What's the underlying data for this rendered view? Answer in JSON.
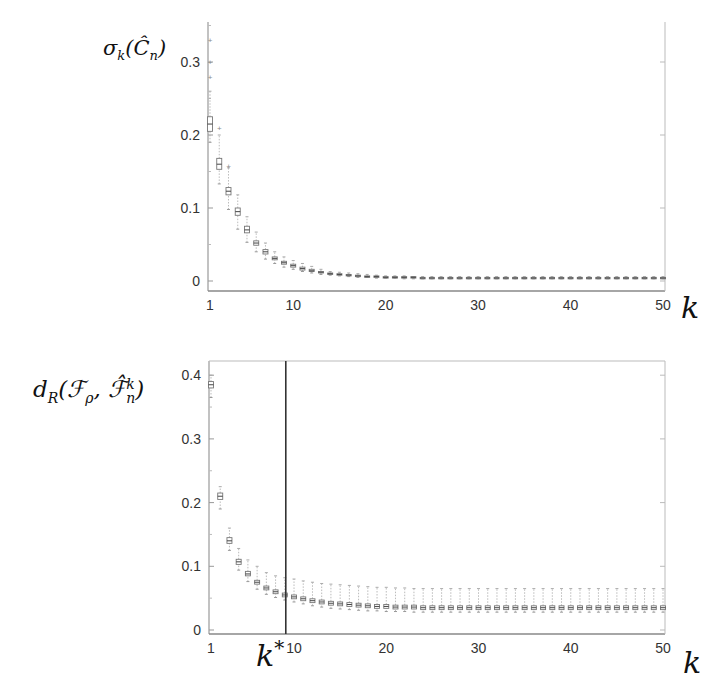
{
  "chart_data": [
    {
      "type": "box",
      "title": "",
      "ylabel": "σ_k(Ĉ_n)",
      "xlabel": "k",
      "xlim": [
        1,
        50
      ],
      "ylim": [
        -0.01,
        0.35
      ],
      "xticks": [
        1,
        10,
        20,
        30,
        40,
        50
      ],
      "yticks": [
        0,
        0.1,
        0.2,
        0.3
      ],
      "ytick_labels": [
        "0",
        "0.1",
        "0.2",
        "0.3"
      ],
      "grid": false,
      "x": [
        1,
        2,
        3,
        4,
        5,
        6,
        7,
        8,
        9,
        10,
        11,
        12,
        13,
        14,
        15,
        16,
        17,
        18,
        19,
        20,
        21,
        22,
        23,
        24,
        25,
        26,
        27,
        28,
        29,
        30,
        31,
        32,
        33,
        34,
        35,
        36,
        37,
        38,
        39,
        40,
        41,
        42,
        43,
        44,
        45,
        46,
        47,
        48,
        49,
        50
      ],
      "median": [
        0.215,
        0.16,
        0.123,
        0.095,
        0.07,
        0.052,
        0.04,
        0.031,
        0.025,
        0.021,
        0.017,
        0.014,
        0.012,
        0.01,
        0.009,
        0.008,
        0.007,
        0.006,
        0.006,
        0.005,
        0.005,
        0.005,
        0.005,
        0.004,
        0.004,
        0.004,
        0.004,
        0.004,
        0.004,
        0.004,
        0.004,
        0.004,
        0.004,
        0.004,
        0.004,
        0.004,
        0.004,
        0.004,
        0.004,
        0.004,
        0.004,
        0.004,
        0.004,
        0.004,
        0.004,
        0.004,
        0.004,
        0.004,
        0.004,
        0.004
      ],
      "q1": [
        0.205,
        0.153,
        0.118,
        0.09,
        0.066,
        0.049,
        0.037,
        0.029,
        0.023,
        0.019,
        0.015,
        0.013,
        0.011,
        0.009,
        0.008,
        0.007,
        0.006,
        0.005,
        0.005,
        0.004,
        0.004,
        0.004,
        0.004,
        0.003,
        0.003,
        0.003,
        0.003,
        0.003,
        0.003,
        0.003,
        0.003,
        0.003,
        0.003,
        0.003,
        0.003,
        0.003,
        0.003,
        0.003,
        0.003,
        0.003,
        0.003,
        0.003,
        0.003,
        0.003,
        0.003,
        0.003,
        0.003,
        0.003,
        0.003,
        0.003
      ],
      "q3": [
        0.225,
        0.168,
        0.128,
        0.1,
        0.075,
        0.055,
        0.043,
        0.033,
        0.027,
        0.023,
        0.019,
        0.016,
        0.013,
        0.011,
        0.01,
        0.009,
        0.008,
        0.007,
        0.007,
        0.006,
        0.006,
        0.006,
        0.006,
        0.005,
        0.005,
        0.005,
        0.005,
        0.005,
        0.005,
        0.005,
        0.005,
        0.005,
        0.005,
        0.005,
        0.005,
        0.005,
        0.005,
        0.005,
        0.005,
        0.005,
        0.005,
        0.005,
        0.005,
        0.005,
        0.005,
        0.005,
        0.005,
        0.005,
        0.005,
        0.005
      ],
      "whisker_low": [
        0.19,
        0.133,
        0.098,
        0.071,
        0.053,
        0.04,
        0.03,
        0.024,
        0.019,
        0.016,
        0.013,
        0.011,
        0.009,
        0.008,
        0.007,
        0.006,
        0.005,
        0.005,
        0.004,
        0.004,
        0.004,
        0.003,
        0.003,
        0.003,
        0.003,
        0.003,
        0.003,
        0.003,
        0.003,
        0.003,
        0.003,
        0.003,
        0.003,
        0.003,
        0.003,
        0.003,
        0.003,
        0.003,
        0.003,
        0.003,
        0.003,
        0.003,
        0.003,
        0.003,
        0.003,
        0.003,
        0.003,
        0.003,
        0.003,
        0.003
      ],
      "whisker_high": [
        0.26,
        0.2,
        0.155,
        0.118,
        0.088,
        0.067,
        0.052,
        0.04,
        0.033,
        0.028,
        0.024,
        0.02,
        0.016,
        0.013,
        0.012,
        0.011,
        0.01,
        0.009,
        0.008,
        0.007,
        0.007,
        0.007,
        0.006,
        0.006,
        0.006,
        0.006,
        0.006,
        0.006,
        0.006,
        0.006,
        0.006,
        0.006,
        0.006,
        0.006,
        0.006,
        0.006,
        0.006,
        0.006,
        0.006,
        0.006,
        0.006,
        0.006,
        0.006,
        0.006,
        0.006,
        0.006,
        0.006,
        0.006,
        0.006,
        0.006
      ],
      "outliers_high": [
        [
          1,
          0.28
        ],
        [
          1,
          0.3
        ],
        [
          1,
          0.33
        ],
        [
          2,
          0.21
        ],
        [
          3,
          0.158
        ]
      ]
    },
    {
      "type": "box",
      "title": "",
      "ylabel": "d_R(F_ρ, F̂_n^k)",
      "xlabel": "k",
      "xlim": [
        1,
        50
      ],
      "ylim": [
        -0.005,
        0.42
      ],
      "xticks": [
        1,
        10,
        20,
        30,
        40,
        50
      ],
      "yticks": [
        0,
        0.1,
        0.2,
        0.3,
        0.4
      ],
      "ytick_labels": [
        "0",
        "0.1",
        "0.2",
        "0.3",
        "0.4"
      ],
      "grid": false,
      "annotations": [
        {
          "type": "vline",
          "x": 9,
          "label": "k*"
        }
      ],
      "x": [
        1,
        2,
        3,
        4,
        5,
        6,
        7,
        8,
        9,
        10,
        11,
        12,
        13,
        14,
        15,
        16,
        17,
        18,
        19,
        20,
        21,
        22,
        23,
        24,
        25,
        26,
        27,
        28,
        29,
        30,
        31,
        32,
        33,
        34,
        35,
        36,
        37,
        38,
        39,
        40,
        41,
        42,
        43,
        44,
        45,
        46,
        47,
        48,
        49,
        50
      ],
      "median": [
        0.385,
        0.21,
        0.14,
        0.107,
        0.088,
        0.075,
        0.066,
        0.06,
        0.055,
        0.052,
        0.049,
        0.046,
        0.044,
        0.042,
        0.041,
        0.04,
        0.039,
        0.038,
        0.037,
        0.037,
        0.036,
        0.036,
        0.036,
        0.035,
        0.035,
        0.035,
        0.035,
        0.035,
        0.035,
        0.035,
        0.035,
        0.035,
        0.035,
        0.035,
        0.035,
        0.035,
        0.035,
        0.035,
        0.035,
        0.035,
        0.035,
        0.035,
        0.035,
        0.035,
        0.035,
        0.035,
        0.035,
        0.035,
        0.035,
        0.035
      ],
      "q1": [
        0.38,
        0.205,
        0.136,
        0.103,
        0.085,
        0.072,
        0.063,
        0.057,
        0.052,
        0.049,
        0.046,
        0.043,
        0.041,
        0.039,
        0.038,
        0.037,
        0.036,
        0.035,
        0.034,
        0.034,
        0.033,
        0.033,
        0.033,
        0.032,
        0.032,
        0.032,
        0.032,
        0.032,
        0.032,
        0.032,
        0.032,
        0.032,
        0.032,
        0.032,
        0.032,
        0.032,
        0.032,
        0.032,
        0.032,
        0.032,
        0.032,
        0.032,
        0.032,
        0.032,
        0.032,
        0.032,
        0.032,
        0.032,
        0.032,
        0.032
      ],
      "q3": [
        0.39,
        0.215,
        0.145,
        0.111,
        0.092,
        0.078,
        0.069,
        0.063,
        0.058,
        0.055,
        0.052,
        0.049,
        0.047,
        0.045,
        0.044,
        0.043,
        0.042,
        0.041,
        0.04,
        0.04,
        0.039,
        0.039,
        0.039,
        0.038,
        0.038,
        0.038,
        0.038,
        0.038,
        0.038,
        0.038,
        0.038,
        0.038,
        0.038,
        0.038,
        0.038,
        0.038,
        0.038,
        0.038,
        0.038,
        0.038,
        0.038,
        0.038,
        0.038,
        0.038,
        0.038,
        0.038,
        0.038,
        0.038,
        0.038,
        0.038
      ],
      "whisker_low": [
        0.365,
        0.19,
        0.125,
        0.094,
        0.076,
        0.064,
        0.056,
        0.051,
        0.047,
        0.044,
        0.041,
        0.038,
        0.036,
        0.034,
        0.033,
        0.032,
        0.031,
        0.03,
        0.03,
        0.029,
        0.029,
        0.029,
        0.028,
        0.028,
        0.028,
        0.028,
        0.028,
        0.028,
        0.028,
        0.028,
        0.028,
        0.028,
        0.028,
        0.028,
        0.028,
        0.028,
        0.028,
        0.028,
        0.028,
        0.028,
        0.028,
        0.028,
        0.028,
        0.028,
        0.028,
        0.028,
        0.028,
        0.028,
        0.028,
        0.028
      ],
      "whisker_high": [
        0.4,
        0.225,
        0.16,
        0.128,
        0.11,
        0.1,
        0.09,
        0.085,
        0.082,
        0.08,
        0.077,
        0.075,
        0.073,
        0.072,
        0.071,
        0.07,
        0.069,
        0.068,
        0.067,
        0.067,
        0.066,
        0.066,
        0.065,
        0.065,
        0.065,
        0.065,
        0.065,
        0.065,
        0.065,
        0.065,
        0.065,
        0.065,
        0.065,
        0.065,
        0.065,
        0.065,
        0.065,
        0.065,
        0.065,
        0.065,
        0.065,
        0.065,
        0.065,
        0.065,
        0.065,
        0.065,
        0.065,
        0.065,
        0.065,
        0.065
      ]
    }
  ],
  "labels": {
    "top_ylabel_main": "σ",
    "top_ylabel_sub": "k",
    "top_ylabel_arg": "(Ĉ",
    "top_ylabel_arg_sub": "n",
    "top_ylabel_close": ")",
    "bottom_ylabel_main": "d",
    "bottom_ylabel_sub": "R",
    "bottom_ylabel_open": "(",
    "bottom_ylabel_f1": "ℱ",
    "bottom_ylabel_f1_sub": "ρ",
    "bottom_ylabel_comma": ", ",
    "bottom_ylabel_f2": "ℱ̂",
    "bottom_ylabel_f2_sup": "k",
    "bottom_ylabel_f2_sub": "n",
    "bottom_ylabel_close": ")",
    "x_axis_label": "k",
    "kstar_label": "k",
    "kstar_sup": "*"
  }
}
